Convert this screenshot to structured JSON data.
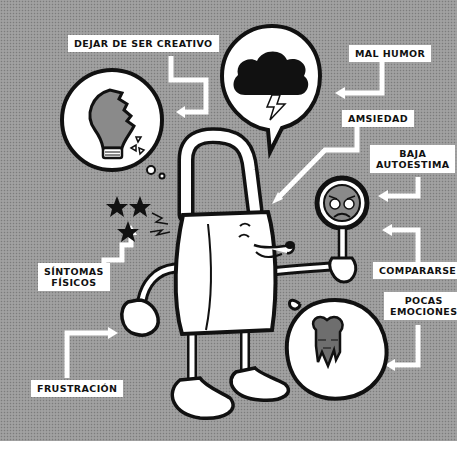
{
  "illustration": {
    "subject": "padlock character with symptoms of creative block",
    "background_color": "#9a9a9a",
    "ink_color": "#111111",
    "paper_color": "#ffffff",
    "bubble_fill": "#ffffff",
    "gray_fill": "#6e6e6e"
  },
  "labels": {
    "dejar_de_ser_creativo": "DEJAR DE SER CREATIVO",
    "mal_humor": "MAL HUMOR",
    "amsiedad": "AMSIEDAD",
    "baja_autoestima_line1": "BAJA",
    "baja_autoestima_line2": "AUTOESTIMA",
    "comparарse": "COMPARARSE",
    "pocas_emociones_line1": "POCAS",
    "pocas_emociones_line2": "EMOCIONES",
    "sintomas_fisicos_line1": "SÍNTOMAS",
    "sintomas_fisicos_line2": "FÍSICOS",
    "frustracion": "FRUSTRACIÓN"
  },
  "icons": {
    "broken_bulb": "broken-lightbulb-icon",
    "storm_cloud": "storm-cloud-icon",
    "sad_mirror": "hand-mirror-sad-face-icon",
    "melting_heart": "melting-heart-icon",
    "dizzy_stars": "dizzy-stars-icon",
    "padlock": "padlock-character-icon"
  }
}
